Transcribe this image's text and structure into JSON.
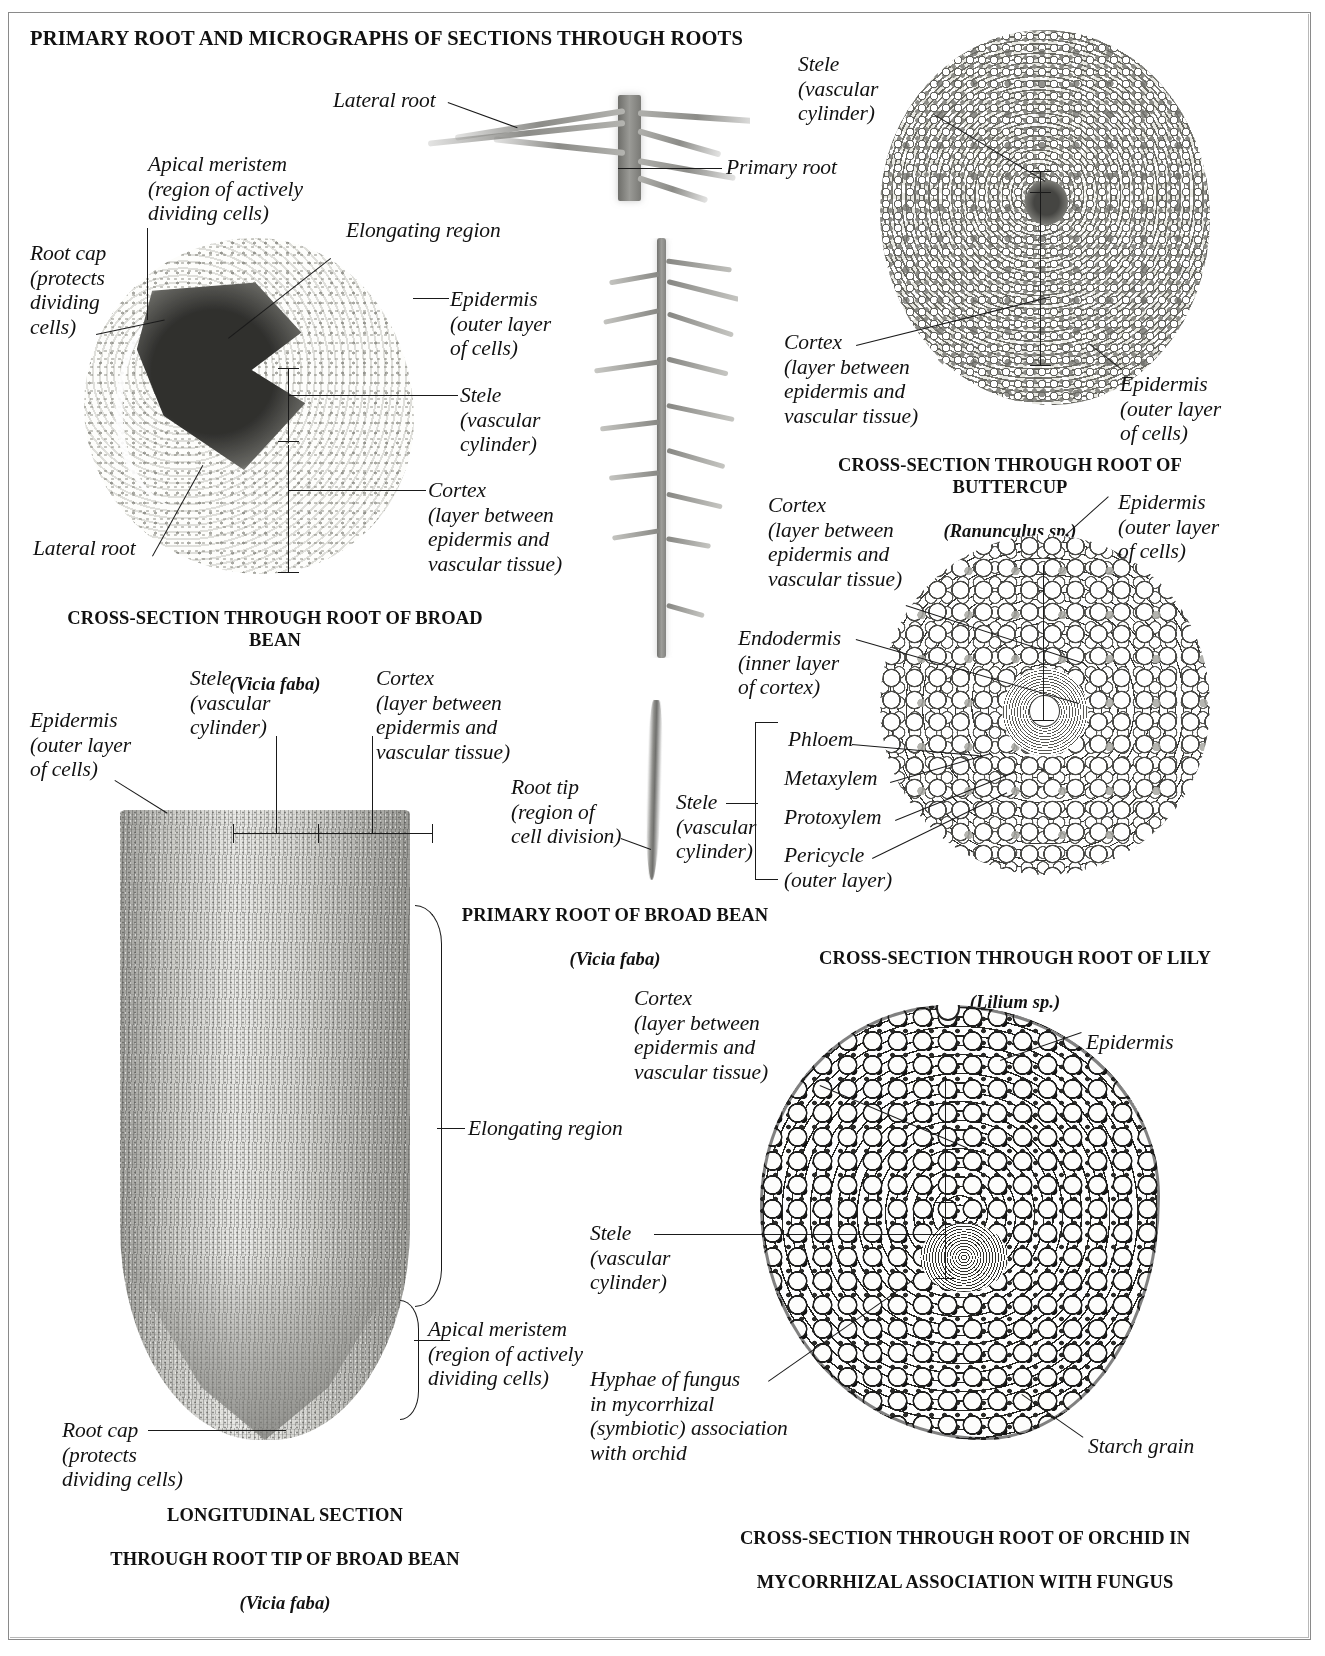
{
  "page": {
    "title": "PRIMARY ROOT AND MICROGRAPHS OF SECTIONS THROUGH ROOTS"
  },
  "figures": [
    {
      "id": "primary-root-photo",
      "caption": "",
      "labels": [
        {
          "key": "lateral_root",
          "text": "Lateral root"
        },
        {
          "key": "primary_root",
          "text": "Primary root"
        }
      ]
    },
    {
      "id": "broad-bean-cross-section",
      "caption_line1": "CROSS-SECTION THROUGH ROOT OF BROAD BEAN",
      "caption_species": "(Vicia faba)",
      "labels": [
        {
          "key": "apical_meristem",
          "text": "Apical meristem\n(region of actively\ndividing cells)"
        },
        {
          "key": "root_cap",
          "text": "Root cap\n(protects\ndividing\ncells)"
        },
        {
          "key": "elongating_region",
          "text": "Elongating region"
        },
        {
          "key": "epidermis",
          "text": "Epidermis\n(outer layer\nof cells)"
        },
        {
          "key": "stele",
          "text": "Stele\n(vascular\ncylinder)"
        },
        {
          "key": "cortex",
          "text": "Cortex\n(layer between\nepidermis and\nvascular tissue)"
        },
        {
          "key": "lateral_root",
          "text": "Lateral root"
        }
      ]
    },
    {
      "id": "buttercup-cross-section",
      "caption_line1": "CROSS-SECTION THROUGH ROOT OF BUTTERCUP",
      "caption_species": "(Ranunculus sp.)",
      "labels": [
        {
          "key": "stele",
          "text": "Stele\n(vascular\ncylinder)"
        },
        {
          "key": "cortex",
          "text": "Cortex\n(layer between\nepidermis and\nvascular tissue)"
        },
        {
          "key": "epidermis",
          "text": "Epidermis\n(outer layer\nof cells)"
        }
      ]
    },
    {
      "id": "lily-cross-section",
      "caption_line1": "CROSS-SECTION THROUGH ROOT OF LILY",
      "caption_species": "(Lilium sp.)",
      "labels": [
        {
          "key": "cortex",
          "text": "Cortex\n(layer between\nepidermis and\nvascular tissue)"
        },
        {
          "key": "epidermis",
          "text": "Epidermis\n(outer layer\nof  cells)"
        },
        {
          "key": "endodermis",
          "text": "Endodermis\n(inner layer\nof cortex)"
        },
        {
          "key": "phloem",
          "text": "Phloem"
        },
        {
          "key": "metaxylem",
          "text": "Metaxylem"
        },
        {
          "key": "protoxylem",
          "text": "Protoxylem"
        },
        {
          "key": "pericycle",
          "text": "Pericycle\n(outer layer)"
        },
        {
          "key": "stele",
          "text": "Stele\n(vascular\ncylinder)"
        }
      ]
    },
    {
      "id": "primary-root-of-broad-bean",
      "caption_line1": "PRIMARY ROOT OF BROAD BEAN",
      "caption_species": "(Vicia faba)",
      "labels": [
        {
          "key": "root_tip",
          "text": "Root tip\n(region of\ncell division)"
        }
      ]
    },
    {
      "id": "longitudinal-section-root-tip",
      "caption_line1": "LONGITUDINAL SECTION",
      "caption_line2": "THROUGH ROOT TIP OF BROAD BEAN",
      "caption_species": "(Vicia faba)",
      "labels": [
        {
          "key": "epidermis",
          "text": "Epidermis\n(outer layer\nof cells)"
        },
        {
          "key": "stele",
          "text": "Stele\n(vascular\ncylinder)"
        },
        {
          "key": "cortex",
          "text": "Cortex\n(layer between\nepidermis and\nvascular tissue)"
        },
        {
          "key": "elongating_region",
          "text": "Elongating region"
        },
        {
          "key": "apical_meristem",
          "text": "Apical meristem\n(region of actively\ndividing cells)"
        },
        {
          "key": "root_cap",
          "text": "Root cap\n(protects\ndividing cells)"
        }
      ]
    },
    {
      "id": "orchid-cross-section",
      "caption_line1": "CROSS-SECTION THROUGH ROOT OF ORCHID IN",
      "caption_line2": "MYCORRHIZAL ASSOCIATION WITH FUNGUS",
      "labels": [
        {
          "key": "cortex",
          "text": "Cortex\n(layer between\nepidermis and\nvascular tissue)"
        },
        {
          "key": "epidermis",
          "text": "Epidermis"
        },
        {
          "key": "stele",
          "text": "Stele\n(vascular\ncylinder)"
        },
        {
          "key": "hyphae",
          "text": "Hyphae of fungus\nin mycorrhizal\n(symbiotic) association\nwith orchid"
        },
        {
          "key": "starch_grain",
          "text": "Starch grain"
        }
      ]
    }
  ]
}
